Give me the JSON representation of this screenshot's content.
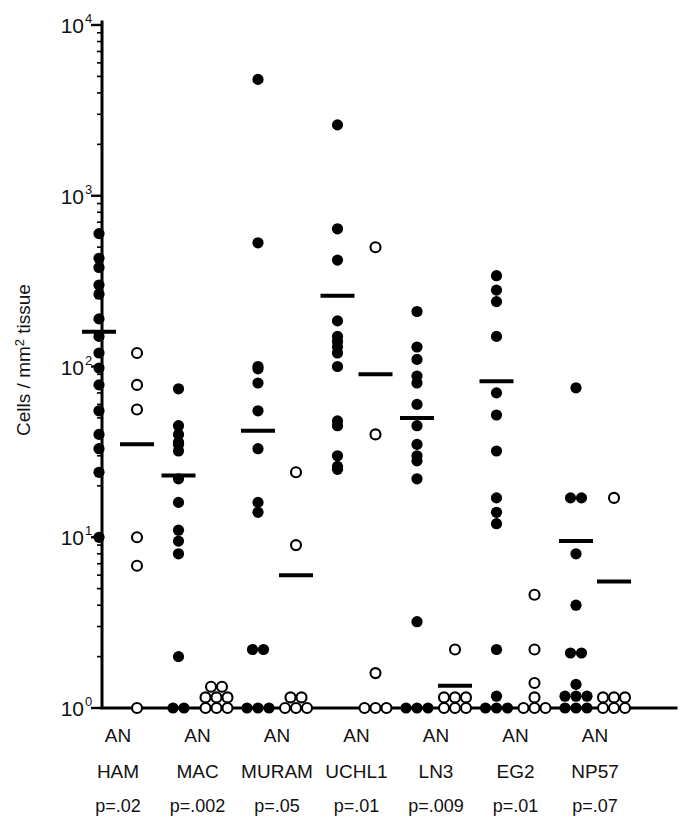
{
  "figure": {
    "title": "",
    "axis": {
      "ylabel": "Cells / mm",
      "ylabel_sup": "2",
      "ylabel_tail": " tissue",
      "ytick_labels": [
        "10",
        "10",
        "10",
        "10",
        "10"
      ],
      "ytick_exponents": [
        "4",
        "3",
        "2",
        "1",
        "0"
      ],
      "ytick_values": [
        10000,
        1000,
        100,
        10,
        1
      ],
      "ymin": 1,
      "ymax": 10000,
      "scale": "log10"
    },
    "legend": {
      "filled_label": "A",
      "open_label": "N",
      "note": "A = asthmatic (filled circles), N = normal (open circles)"
    }
  },
  "chart_data": {
    "type": "scatter",
    "title": "",
    "xlabel": "",
    "ylabel": "Cells / mm2 tissue",
    "yscale": "log",
    "ylim": [
      1,
      10000
    ],
    "ytick_labels": [
      "10^0",
      "10^1",
      "10^2",
      "10^3",
      "10^4"
    ],
    "grid": false,
    "legend_position": "none",
    "marker_styles": {
      "A": "filled-circle",
      "N": "open-circle"
    },
    "groups": [
      {
        "name": "HAM",
        "condition_label": "AN",
        "pvalue_label": "p=.02",
        "pvalue": 0.02,
        "series": [
          {
            "name": "A",
            "marker": "filled-circle",
            "median": 160,
            "values": [
              600,
              430,
              380,
              300,
              265,
              190,
              150,
              120,
              98,
              78,
              55,
              40,
              33,
              24,
              10
            ]
          },
          {
            "name": "N",
            "marker": "open-circle",
            "median": 35,
            "values": [
              120,
              78,
              56,
              10,
              6.8,
              1
            ]
          }
        ]
      },
      {
        "name": "MAC",
        "condition_label": "AN",
        "pvalue_label": "p=.002",
        "pvalue": 0.002,
        "series": [
          {
            "name": "A",
            "marker": "filled-circle",
            "median": 23,
            "values": [
              74,
              45,
              40,
              36,
              35,
              32,
              22,
              16,
              11,
              9.5,
              8.0,
              2.0,
              1,
              1
            ]
          },
          {
            "name": "N",
            "marker": "open-circle",
            "median": null,
            "values": [
              1,
              1,
              1,
              1,
              1,
              1,
              1,
              1
            ]
          }
        ]
      },
      {
        "name": "MURAM",
        "condition_label": "AN",
        "pvalue_label": "p=.05",
        "pvalue": 0.05,
        "series": [
          {
            "name": "A",
            "marker": "filled-circle",
            "median": 42,
            "values": [
              4800,
              530,
              100,
              97,
              80,
              55,
              33,
              16,
              14,
              2.2,
              2.2,
              1,
              1,
              1
            ]
          },
          {
            "name": "N",
            "marker": "open-circle",
            "median": 6.0,
            "values": [
              24,
              9.0,
              1,
              1,
              1,
              1,
              1
            ]
          }
        ]
      },
      {
        "name": "UCHL1",
        "condition_label": "AN",
        "pvalue_label": "p=.01",
        "pvalue": 0.01,
        "series": [
          {
            "name": "A",
            "marker": "filled-circle",
            "median": 260,
            "values": [
              2600,
              640,
              420,
              185,
              150,
              140,
              130,
              120,
              100,
              48,
              45,
              30,
              26,
              25
            ]
          },
          {
            "name": "N",
            "marker": "open-circle",
            "median": 90,
            "values": [
              500,
              40,
              1.6,
              1,
              1,
              1
            ]
          }
        ]
      },
      {
        "name": "LN3",
        "condition_label": "AN",
        "pvalue_label": "p=.009",
        "pvalue": 0.009,
        "series": [
          {
            "name": "A",
            "marker": "filled-circle",
            "median": 50,
            "values": [
              210,
              130,
              110,
              88,
              80,
              60,
              45,
              35,
              30,
              28,
              22,
              3.2,
              1,
              1,
              1
            ]
          },
          {
            "name": "N",
            "marker": "open-circle",
            "median": 1.35,
            "values": [
              2.2,
              1,
              1,
              1,
              1,
              1,
              1
            ]
          }
        ]
      },
      {
        "name": "EG2",
        "condition_label": "AN",
        "pvalue_label": "p=.01",
        "pvalue": 0.01,
        "series": [
          {
            "name": "A",
            "marker": "filled-circle",
            "median": 82,
            "values": [
              340,
              280,
              240,
              150,
              70,
              52,
              32,
              17,
              14,
              12,
              2.2,
              1,
              1,
              1,
              1
            ]
          },
          {
            "name": "N",
            "marker": "open-circle",
            "median": null,
            "values": [
              4.6,
              2.2,
              1.4,
              1,
              1,
              1,
              1
            ]
          }
        ]
      },
      {
        "name": "NP57",
        "condition_label": "AN",
        "pvalue_label": "p=.07",
        "pvalue": 0.07,
        "series": [
          {
            "name": "A",
            "marker": "filled-circle",
            "median": 9.5,
            "values": [
              75,
              17,
              17,
              8.0,
              4.0,
              2.1,
              2.1,
              1,
              1,
              1,
              1,
              1,
              1,
              1
            ]
          },
          {
            "name": "N",
            "marker": "open-circle",
            "median": 5.5,
            "values": [
              17,
              1,
              1,
              1,
              1,
              1,
              1
            ]
          }
        ]
      }
    ]
  }
}
